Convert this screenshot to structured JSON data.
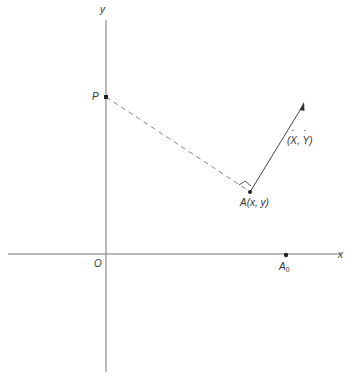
{
  "diagram": {
    "axes": {
      "x_label": "x",
      "y_label": "y",
      "origin_label": "O"
    },
    "points": {
      "P": {
        "label": "P"
      },
      "A": {
        "label": "A(x, y)"
      },
      "A0": {
        "label": "A",
        "subscript": "0"
      }
    },
    "velocity": {
      "open": "(",
      "x_dot": "X",
      "sep": ", ",
      "y_dot": "Y",
      "close": ")"
    },
    "colors": {
      "line": "#555555",
      "text": "#333333"
    }
  }
}
